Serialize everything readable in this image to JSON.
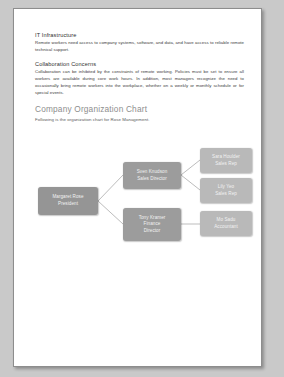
{
  "document": {
    "sections": [
      {
        "heading": "IT Infrastructure",
        "body": "Remote workers need access to company systems, software, and data, and have access to reliable remote technical support."
      },
      {
        "heading": "Collaboration Concerns",
        "body": "Collaboration can be inhibited by the constraints of remote working. Policies must be set to ensure all workers are available during core work hours. In addition, most managers recognize the need to occasionally bring remote workers into the workplace, whether on a weekly or monthly schedule or for special events."
      }
    ],
    "chart_heading": "Company Organization Chart",
    "chart_intro": "Following is the organization chart for Rose Management."
  },
  "org_chart": {
    "nodes": [
      {
        "id": "president",
        "name": "Margaret Rose",
        "title": "President",
        "tone": "dark"
      },
      {
        "id": "sales",
        "name": "Sven Knudson",
        "title": "Sales Director",
        "tone": "mid"
      },
      {
        "id": "finance",
        "name": "Tony Kramer",
        "title": "Finance",
        "title2": "Director",
        "tone": "mid"
      },
      {
        "id": "rep1",
        "name": "Sara Houlder",
        "title": "Sales Rep",
        "tone": "light"
      },
      {
        "id": "rep2",
        "name": "Lily Yeo",
        "title": "Sales Rep",
        "tone": "light"
      },
      {
        "id": "acct",
        "name": "Mo Sadu",
        "title": "Accountant",
        "tone": "light"
      }
    ],
    "colors": {
      "dark": "#959595",
      "mid": "#9c9c9c",
      "light": "#b9b9b9",
      "connector": "#bdbdbd"
    }
  },
  "colors": {
    "page_background": "#ffffff",
    "canvas_background": "#c9c9c9",
    "heading_accent": "#8e8e8e"
  }
}
